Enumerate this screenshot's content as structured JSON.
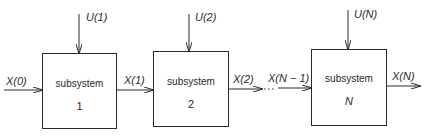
{
  "diagram": {
    "type": "block-diagram",
    "colors": {
      "stroke": "#2a2a2a",
      "background": "#ffffff"
    },
    "blocks": [
      {
        "id": "1",
        "title": "subsystem",
        "number": "1",
        "control_input": "U(1)"
      },
      {
        "id": "2",
        "title": "subsystem",
        "number": "2",
        "control_input": "U(2)"
      },
      {
        "id": "N",
        "title": "subsystem",
        "number": "N",
        "control_input": "U(N)"
      }
    ],
    "signals": {
      "x0": "X(0)",
      "x1": "X(1)",
      "x2": "X(2)",
      "xn_minus_1": "X(N − 1)",
      "xn": "X(N)"
    }
  }
}
